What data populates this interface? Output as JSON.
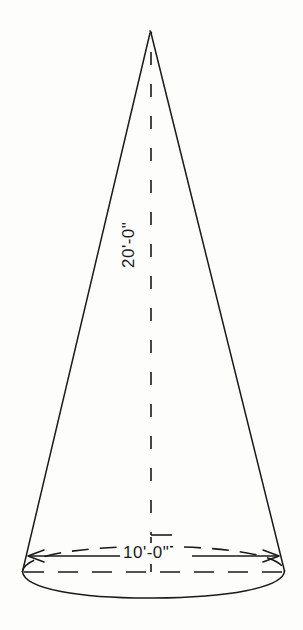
{
  "drawing": {
    "title": "Cone elevation drawing",
    "background_color": "#fdfdfc",
    "line_color": "#1a1a1a",
    "shape": "cone",
    "view": "elevation",
    "dimensions": {
      "height_label": "20'-0\"",
      "diameter_label": "10'-0\""
    },
    "geometry": {
      "apex": {
        "x": 150,
        "y": 32
      },
      "base_left": {
        "x": 22,
        "y": 572
      },
      "base_right": {
        "x": 285,
        "y": 572
      },
      "base_center": {
        "x": 153.5,
        "y": 572
      },
      "base_rx": 131.5,
      "base_ry": 25,
      "centerline_x": 151
    },
    "elements": {
      "left_slant_name": "cone-left-slant-line",
      "right_slant_name": "cone-right-slant-line",
      "base_front_arc_name": "cone-base-front-arc",
      "base_back_arc_name": "cone-base-back-arc-hidden",
      "centerline_name": "cone-vertical-centerline",
      "height_dim_name": "height-dimension-line",
      "diameter_dim_name": "diameter-dimension-line"
    }
  }
}
